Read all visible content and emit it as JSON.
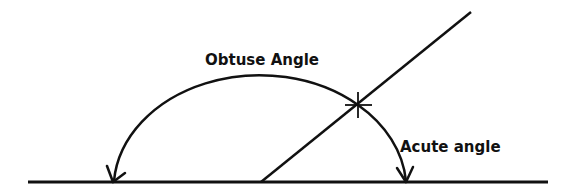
{
  "diagram": {
    "labels": {
      "obtuse": "Obtuse Angle",
      "acute": "Acute angle"
    },
    "colors": {
      "stroke": "#111111",
      "background": "#ffffff"
    },
    "elements": [
      {
        "type": "baseline",
        "from": [
          28,
          182
        ],
        "to": [
          548,
          182
        ]
      },
      {
        "type": "ray",
        "from": [
          261,
          182
        ],
        "to": [
          471,
          12
        ]
      },
      {
        "type": "arc",
        "center": [
          260,
          182
        ],
        "rx": 146,
        "ry": 114,
        "arrowheads": [
          [
            113,
            182
          ],
          [
            406,
            182
          ]
        ]
      },
      {
        "type": "intersection-mark",
        "at": [
          358,
          105
        ]
      }
    ]
  }
}
